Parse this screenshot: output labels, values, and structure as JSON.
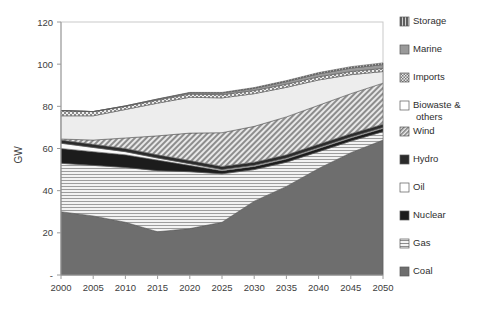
{
  "chart_data": {
    "type": "area",
    "title": "",
    "xlabel": "",
    "ylabel": "GW",
    "x": [
      2000,
      2005,
      2010,
      2015,
      2020,
      2025,
      2030,
      2035,
      2040,
      2045,
      2050
    ],
    "xtick_labels": [
      "2000",
      "2005",
      "2010",
      "2015",
      "2020",
      "2025",
      "2030",
      "2035",
      "2040",
      "2045",
      "2050"
    ],
    "ytick_labels": [
      "-",
      "20",
      "40",
      "60",
      "80",
      "100",
      "120"
    ],
    "ytick_values": [
      0,
      20,
      40,
      60,
      80,
      100,
      120
    ],
    "ylim": [
      0,
      120
    ],
    "xlim": [
      2000,
      2050
    ],
    "grid": false,
    "legend_position": "right",
    "stack_order_bottom_to_top": [
      "Coal",
      "Gas",
      "Nuclear",
      "Oil",
      "Hydro",
      "Wind",
      "Biowaste & others",
      "Imports",
      "Marine",
      "Storage"
    ],
    "series": [
      {
        "name": "Coal",
        "pattern": "solid-dark-gray",
        "color": "#6e6e6e",
        "values": [
          30.0,
          28.0,
          25.0,
          20.5,
          22.0,
          25.0,
          35.0,
          42.0,
          50.5,
          58.0,
          64.0
        ]
      },
      {
        "name": "Gas",
        "pattern": "horizontal-lines",
        "color": "#e3e3e3",
        "values": [
          23.0,
          24.0,
          26.0,
          29.0,
          27.0,
          23.0,
          15.0,
          11.5,
          8.0,
          5.5,
          4.0
        ]
      },
      {
        "name": "Nuclear",
        "pattern": "solid-black",
        "color": "#1c1c1c",
        "values": [
          7.0,
          6.5,
          6.0,
          5.0,
          3.0,
          1.5,
          1.5,
          1.5,
          1.5,
          1.5,
          1.5
        ]
      },
      {
        "name": "Oil",
        "pattern": "solid-white",
        "color": "#fbfbfb",
        "values": [
          2.5,
          2.0,
          1.5,
          1.0,
          0.8,
          0.5,
          0.5,
          0.5,
          0.5,
          0.5,
          0.5
        ]
      },
      {
        "name": "Hydro",
        "pattern": "solid-darkest",
        "color": "#2b2b2b",
        "values": [
          1.5,
          1.5,
          1.5,
          1.5,
          1.5,
          1.5,
          1.5,
          1.5,
          1.5,
          1.5,
          1.5
        ]
      },
      {
        "name": "Wind",
        "pattern": "diagonal-hatch",
        "color": "#bdbdbd",
        "values": [
          0.5,
          2.0,
          5.0,
          9.0,
          13.0,
          16.0,
          17.0,
          18.0,
          18.5,
          19.0,
          19.5
        ]
      },
      {
        "name": "Biowaste & others",
        "pattern": "solid-light",
        "color": "#ededed",
        "values": [
          11.0,
          11.5,
          13.5,
          15.5,
          17.0,
          16.5,
          15.5,
          14.0,
          12.0,
          9.0,
          5.5
        ]
      },
      {
        "name": "Imports",
        "pattern": "checkered",
        "color": "#cfcfcf",
        "values": [
          2.5,
          2.0,
          1.5,
          1.5,
          1.5,
          1.5,
          1.5,
          1.5,
          1.5,
          1.5,
          1.5
        ]
      },
      {
        "name": "Marine",
        "pattern": "solid-gray",
        "color": "#9a9a9a",
        "values": [
          0.0,
          0.0,
          0.2,
          0.4,
          0.6,
          0.8,
          1.0,
          1.2,
          1.4,
          1.6,
          1.8
        ]
      },
      {
        "name": "Storage",
        "pattern": "vertical-lines",
        "color": "#808080",
        "values": [
          0.0,
          0.0,
          0.0,
          0.1,
          0.2,
          0.3,
          0.4,
          0.5,
          0.6,
          0.7,
          0.8
        ]
      }
    ],
    "totals": [
      78.0,
      77.5,
      80.2,
      83.5,
      86.6,
      86.6,
      88.9,
      92.2,
      95.5,
      97.3,
      99.1
    ]
  },
  "legend": {
    "items": [
      {
        "label": "Storage",
        "swatch": "vertical-lines"
      },
      {
        "label": "Marine",
        "swatch": "solid-gray"
      },
      {
        "label": "Imports",
        "swatch": "checkered"
      },
      {
        "label": "Biowaste & others",
        "swatch": "solid-white",
        "line1": "Biowaste &",
        "line2": "others"
      },
      {
        "label": "Wind",
        "swatch": "diagonal-hatch"
      },
      {
        "label": "Hydro",
        "swatch": "solid-darkest"
      },
      {
        "label": "Oil",
        "swatch": "solid-white"
      },
      {
        "label": "Nuclear",
        "swatch": "solid-black"
      },
      {
        "label": "Gas",
        "swatch": "horizontal-lines"
      },
      {
        "label": "Coal",
        "swatch": "solid-dark-gray"
      }
    ]
  },
  "colors": {
    "plot_border": "#c8c8c8",
    "axis_line": "#9a9a9a",
    "text": "#3a3a3a",
    "background": "#ffffff"
  }
}
